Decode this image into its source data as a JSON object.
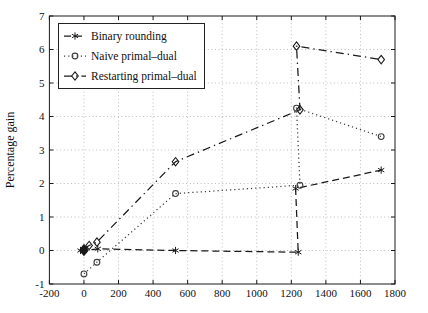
{
  "figure": {
    "background": "#ffffff",
    "axis_color": "#1a1a1a",
    "grid_color": "#bdbdbd",
    "text_color": "#111111"
  },
  "chart_data": {
    "type": "line",
    "title": "",
    "xlabel": "",
    "ylabel": "Percentage gain",
    "xlim": [
      -200,
      1800
    ],
    "ylim": [
      -1,
      7
    ],
    "x_ticks": [
      -200,
      0,
      200,
      400,
      600,
      800,
      1000,
      1200,
      1400,
      1600,
      1800
    ],
    "y_ticks": [
      -1,
      0,
      1,
      2,
      3,
      4,
      5,
      6,
      7
    ],
    "grid": true,
    "legend_position": "top-left",
    "series": [
      {
        "name": "Binary rounding",
        "line_style": "dashed",
        "marker": "star",
        "color": "#1a1a1a",
        "points": [
          [
            -20,
            0
          ],
          [
            0,
            0
          ],
          [
            80,
            0.05
          ],
          [
            530,
            0
          ],
          [
            1240,
            -0.05
          ],
          [
            1225,
            1.85
          ],
          [
            1720,
            2.4
          ]
        ]
      },
      {
        "name": "Naive primal–dual",
        "line_style": "dotted",
        "marker": "circle",
        "color": "#3d3d3d",
        "points": [
          [
            0,
            -0.7
          ],
          [
            75,
            -0.35
          ],
          [
            530,
            1.7
          ],
          [
            1250,
            1.95
          ],
          [
            1230,
            4.25
          ],
          [
            1720,
            3.4
          ]
        ]
      },
      {
        "name": "Restarting primal–dual",
        "line_style": "dashdot",
        "marker": "diamond",
        "color": "#1a1a1a",
        "points": [
          [
            0,
            0.05
          ],
          [
            30,
            0.15
          ],
          [
            75,
            0.25
          ],
          [
            530,
            2.65
          ],
          [
            1250,
            4.2
          ],
          [
            1230,
            6.1
          ],
          [
            1720,
            5.7
          ]
        ]
      }
    ],
    "annotations": [
      {
        "type": "filled-diamond-cluster",
        "x": 0,
        "y": 0
      }
    ]
  }
}
